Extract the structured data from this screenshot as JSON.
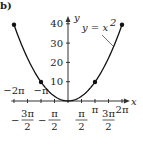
{
  "panel_label": "b)",
  "chart_data": {
    "type": "line",
    "title": "",
    "xlabel": "x",
    "ylabel": "y",
    "xlim": [
      -6.6,
      7.2
    ],
    "ylim": [
      0,
      44
    ],
    "function": "y = x^2",
    "curve_label": "y = x",
    "curve_label_exp": "2",
    "x_ticks": [
      {
        "value": -6.2832,
        "label": "−2π",
        "pos": "upper"
      },
      {
        "value": -4.7124,
        "num": "3π",
        "den": "2",
        "neg": true,
        "pos": "lower"
      },
      {
        "value": -3.1416,
        "label": "−π",
        "pos": "upper"
      },
      {
        "value": -1.5708,
        "num": "π",
        "den": "2",
        "neg": true,
        "pos": "lower"
      },
      {
        "value": 1.5708,
        "num": "π",
        "den": "2",
        "neg": false,
        "pos": "lower"
      },
      {
        "value": 3.1416,
        "label": "π",
        "pos": "inline"
      },
      {
        "value": 4.7124,
        "num": "3π",
        "den": "2",
        "neg": false,
        "pos": "lower"
      },
      {
        "value": 6.2832,
        "label": "2π",
        "pos": "inline"
      }
    ],
    "y_ticks": [
      10,
      20,
      30,
      40
    ],
    "highlighted_points": [
      {
        "x": -6.2832,
        "y": 39.48
      },
      {
        "x": -3.1416,
        "y": 9.87
      },
      {
        "x": 3.1416,
        "y": 9.87
      },
      {
        "x": 6.2832,
        "y": 39.48
      }
    ],
    "curve_domain": [
      -6.2832,
      6.2832
    ],
    "grid": false
  }
}
